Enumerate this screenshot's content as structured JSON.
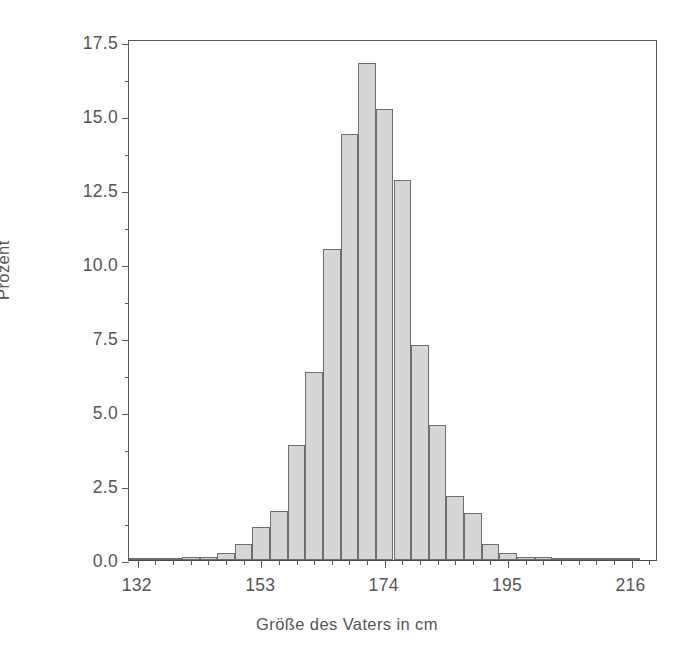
{
  "chart_data": {
    "type": "bar",
    "title": "",
    "subtitle": "",
    "xlabel": "Größe des Vaters in cm",
    "ylabel": "Prozent",
    "xlim": [
      130.5,
      220.5
    ],
    "ylim": [
      0.0,
      17.6
    ],
    "grid": false,
    "legend": null,
    "bin_width": 3,
    "x_tick_labels": [
      "132",
      "153",
      "174",
      "195",
      "216"
    ],
    "x_tick_values": [
      132,
      153,
      174,
      195,
      216
    ],
    "y_tick_labels": [
      "0.0",
      "2.5",
      "5.0",
      "7.5",
      "10.0",
      "12.5",
      "15.0",
      "17.5"
    ],
    "y_tick_values": [
      0.0,
      2.5,
      5.0,
      7.5,
      10.0,
      12.5,
      15.0,
      17.5
    ],
    "categories": [
      "132",
      "135",
      "138",
      "141",
      "144",
      "147",
      "150",
      "153",
      "156",
      "159",
      "162",
      "165",
      "168",
      "171",
      "174",
      "177",
      "180",
      "183",
      "186",
      "189",
      "192",
      "195",
      "198",
      "201",
      "204",
      "207",
      "210",
      "213",
      "216"
    ],
    "values": [
      0.05,
      0.05,
      0.05,
      0.1,
      0.1,
      0.25,
      0.55,
      1.1,
      1.65,
      3.9,
      6.35,
      10.5,
      14.4,
      16.8,
      15.25,
      12.85,
      7.25,
      4.55,
      2.15,
      1.6,
      0.55,
      0.25,
      0.1,
      0.1,
      0.05,
      0.05,
      0.05,
      0.05,
      0.05
    ],
    "bar_color": "#d6d6d6",
    "bar_edge_color": "#6e6e6e",
    "axis_color": "#5a5a5a",
    "background_color": "#ffffff"
  },
  "axes": {
    "y_title": "Prozent",
    "x_title": "Größe des Vaters in cm"
  }
}
